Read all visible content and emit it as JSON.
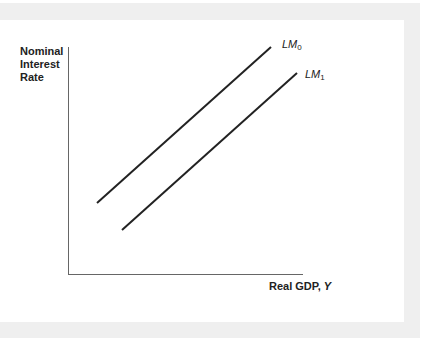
{
  "chart_data": {
    "type": "line",
    "title": "",
    "xlabel": "Real GDP, Y",
    "xlabel_text": "Real GDP,",
    "xlabel_var": "Y",
    "ylabel": "Nominal Interest Rate",
    "ylabel_lines": [
      "Nominal",
      "Interest",
      "Rate"
    ],
    "grid": false,
    "ticks": false,
    "series": [
      {
        "name": "LM0",
        "label_main": "LM",
        "label_sub": "0",
        "points": [
          [
            97,
            203
          ],
          [
            271,
            47
          ]
        ],
        "color": "#222222"
      },
      {
        "name": "LM1",
        "label_main": "LM",
        "label_sub": "1",
        "points": [
          [
            122,
            230
          ],
          [
            297,
            73
          ]
        ],
        "color": "#222222"
      }
    ],
    "axes": {
      "origin": [
        68,
        274
      ],
      "x_end": 303,
      "y_top": 47,
      "color": "#666666"
    },
    "note": "Schematic diagram: LM curve shifts right from LM0 to LM1; no numeric scale."
  }
}
